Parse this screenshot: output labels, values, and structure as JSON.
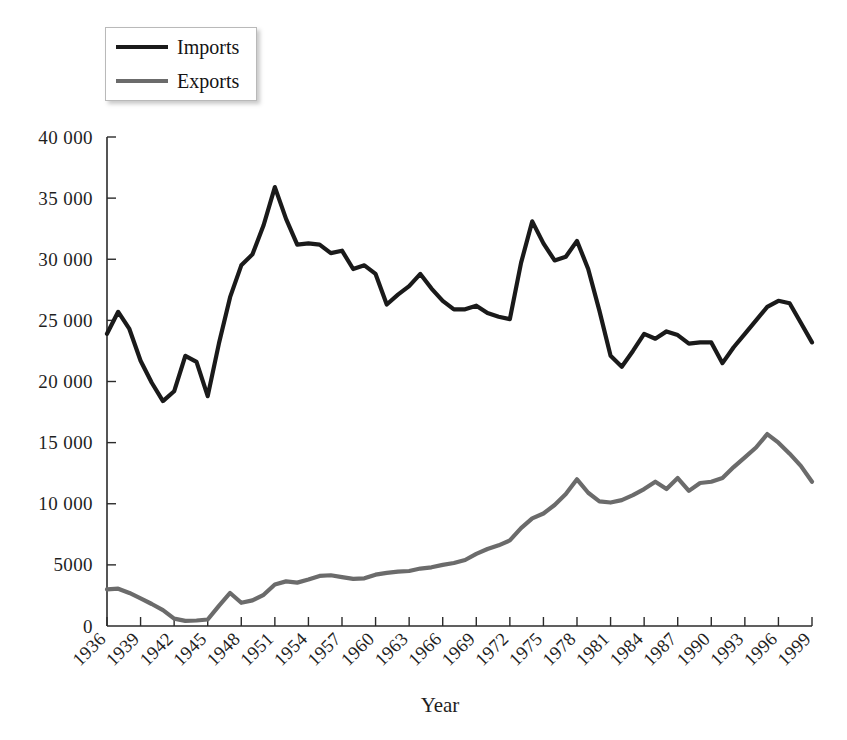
{
  "chart_data": {
    "type": "line",
    "title": "",
    "xlabel": "Year",
    "ylabel": "",
    "xlim": [
      1936,
      1999
    ],
    "ylim": [
      0,
      40000
    ],
    "grid": false,
    "legend_position": "top-left",
    "x_tick_labels": [
      "1936",
      "1939",
      "1942",
      "1945",
      "1948",
      "1951",
      "1954",
      "1957",
      "1960",
      "1963",
      "1966",
      "1969",
      "1972",
      "1975",
      "1978",
      "1981",
      "1984",
      "1987",
      "1990",
      "1993",
      "1996",
      "1999"
    ],
    "x_tick_values": [
      1936,
      1939,
      1942,
      1945,
      1948,
      1951,
      1954,
      1957,
      1960,
      1963,
      1966,
      1969,
      1972,
      1975,
      1978,
      1981,
      1984,
      1987,
      1990,
      1993,
      1996,
      1999
    ],
    "y_tick_labels": [
      "0",
      "5000",
      "10 000",
      "15 000",
      "20 000",
      "25 000",
      "30 000",
      "35 000",
      "40 000"
    ],
    "y_tick_values": [
      0,
      5000,
      10000,
      15000,
      20000,
      25000,
      30000,
      35000,
      40000
    ],
    "x": [
      1936,
      1937,
      1938,
      1939,
      1940,
      1941,
      1942,
      1943,
      1944,
      1945,
      1946,
      1947,
      1948,
      1949,
      1950,
      1951,
      1952,
      1953,
      1954,
      1955,
      1956,
      1957,
      1958,
      1959,
      1960,
      1961,
      1962,
      1963,
      1964,
      1965,
      1966,
      1967,
      1968,
      1969,
      1970,
      1971,
      1972,
      1973,
      1974,
      1975,
      1976,
      1977,
      1978,
      1979,
      1980,
      1981,
      1982,
      1983,
      1984,
      1985,
      1986,
      1987,
      1988,
      1989,
      1990,
      1991,
      1992,
      1993,
      1994,
      1995,
      1996,
      1997,
      1998,
      1999
    ],
    "series": [
      {
        "name": "Imports",
        "color": "#1a1a1a",
        "stroke_width": 4.2,
        "values": [
          23900,
          25700,
          24300,
          21700,
          19900,
          18400,
          19200,
          22100,
          21600,
          18800,
          23100,
          26900,
          29500,
          30400,
          32800,
          35900,
          33300,
          31200,
          31300,
          31200,
          30500,
          30700,
          29200,
          29500,
          28800,
          26300,
          27100,
          27800,
          28800,
          27600,
          26600,
          25900,
          25900,
          26200,
          25600,
          25300,
          25100,
          29700,
          33100,
          31300,
          29900,
          30200,
          31500,
          29200,
          25800,
          22100,
          21200,
          22500,
          23900,
          23500,
          24100,
          23800,
          23100,
          23200,
          23200,
          21500,
          22800,
          23900,
          25000,
          26100,
          26600,
          26400,
          24800,
          23200
        ]
      },
      {
        "name": "Exports",
        "color": "#6b6b6b",
        "stroke_width": 4.2,
        "values": [
          3000,
          3050,
          2700,
          2250,
          1800,
          1300,
          600,
          420,
          450,
          530,
          1650,
          2700,
          1900,
          2100,
          2550,
          3400,
          3650,
          3550,
          3800,
          4100,
          4150,
          4000,
          3850,
          3900,
          4200,
          4350,
          4450,
          4500,
          4700,
          4800,
          5000,
          5150,
          5400,
          5900,
          6300,
          6600,
          7000,
          8000,
          8800,
          9200,
          9900,
          10800,
          12000,
          10900,
          10200,
          10100,
          10300,
          10700,
          11200,
          11800,
          11200,
          12100,
          11050,
          11700,
          11800,
          12100,
          13000,
          13800,
          14600,
          15700,
          15000,
          14100,
          13100,
          11800
        ]
      }
    ]
  },
  "legend": {
    "items": [
      {
        "label": "Imports",
        "color": "#1a1a1a"
      },
      {
        "label": "Exports",
        "color": "#6b6b6b"
      }
    ]
  },
  "axes": {
    "x_title": "Year"
  }
}
